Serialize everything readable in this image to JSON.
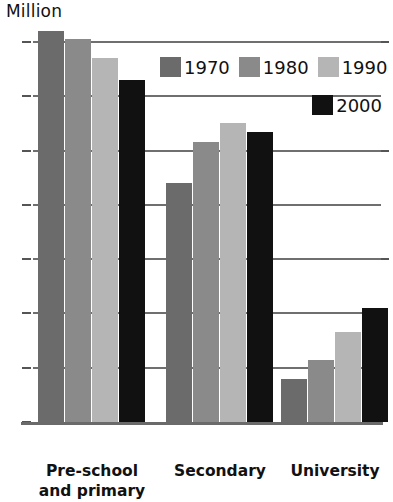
{
  "chart_data": {
    "type": "bar",
    "title": "Million",
    "xlabel": "",
    "ylabel": "Million",
    "ylim": [
      0,
      7
    ],
    "yticks": [
      0,
      1,
      2,
      3,
      4,
      5,
      6,
      7
    ],
    "ytick_labels": [
      "0",
      "1",
      "2",
      "3",
      "4",
      "5",
      "6",
      "7"
    ],
    "grid": true,
    "legend_position": "top-right",
    "categories": [
      "Pre-school\nand primary",
      "Secondary",
      "University"
    ],
    "category_labels_plain": [
      "Pre-school and primary",
      "Secondary",
      "University"
    ],
    "series": [
      {
        "name": "1970",
        "color": "#6b6b6b",
        "values": [
          7.2,
          4.4,
          0.8
        ]
      },
      {
        "name": "1980",
        "color": "#8a8a8a",
        "values": [
          7.05,
          5.15,
          1.15
        ]
      },
      {
        "name": "1990",
        "color": "#b5b5b5",
        "values": [
          6.7,
          5.5,
          1.65
        ]
      },
      {
        "name": "2000",
        "color": "#111111",
        "values": [
          6.3,
          5.35,
          2.1
        ]
      }
    ]
  },
  "legend": {
    "row1": [
      {
        "label": "1970",
        "color": "#6b6b6b"
      },
      {
        "label": "1980",
        "color": "#8a8a8a"
      },
      {
        "label": "1990",
        "color": "#b5b5b5"
      }
    ],
    "row2": [
      {
        "label": "2000",
        "color": "#111111"
      }
    ]
  },
  "axis": {
    "title": "Million"
  }
}
